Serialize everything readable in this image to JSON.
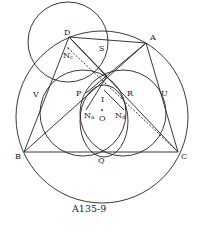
{
  "caption": "A135-9",
  "colors": {
    "stroke": "#222222",
    "background": "#ffffff"
  },
  "labels": {
    "D": "D",
    "S": "S",
    "A": "A",
    "Nc": "N",
    "Nc_sub": "c",
    "V": "V",
    "P": "P",
    "I": "I",
    "R": "R",
    "U": "U",
    "Na": "N",
    "Na_sub": "a",
    "O": "O",
    "Nd": "N",
    "Nd_sub": "d",
    "B": "B",
    "Q": "Q",
    "C": "C"
  },
  "points": {
    "A": [
      146,
      43
    ],
    "B": [
      24,
      152
    ],
    "C": [
      178,
      152
    ],
    "D": [
      69,
      37
    ],
    "S": [
      101,
      43
    ],
    "V": [
      40,
      93
    ],
    "U": [
      165,
      93
    ],
    "P": [
      86,
      93
    ],
    "R": [
      124,
      93
    ],
    "I": [
      104,
      96
    ],
    "Q": [
      102,
      152
    ],
    "O": [
      102,
      110
    ],
    "Na": [
      86,
      110
    ],
    "Nd": [
      124,
      110
    ],
    "Nc": [
      68,
      48
    ],
    "X": [
      107,
      76
    ]
  },
  "circles": {
    "circumcircle": {
      "cx": 102,
      "cy": 117,
      "r": 86
    },
    "circle_D": {
      "cx": 68,
      "cy": 42,
      "r": 40
    },
    "circle_left": {
      "cx": 83,
      "cy": 113,
      "r": 43
    },
    "circle_right": {
      "cx": 123,
      "cy": 113,
      "r": 43
    },
    "circle_inner": {
      "cx": 104,
      "cy": 121,
      "r": 37
    }
  }
}
